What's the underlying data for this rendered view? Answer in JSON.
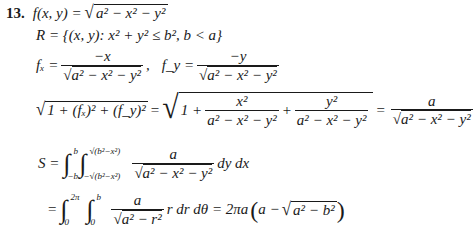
{
  "problem": {
    "number": "13.",
    "line1": {
      "lhs": "f(x, y) =",
      "radicand": "a² − x² − y²"
    },
    "line2": {
      "text": "R = {(x, y): x² + y² ≤ b²,  b < a}"
    },
    "line3": {
      "fx_label": "fₓ =",
      "fx_num": "−x",
      "fx_den": "a² − x² − y²",
      "sep": ",",
      "fy_label": "f_y =",
      "fy_num": "−y",
      "fy_den": "a² − x² − y²"
    },
    "line4": {
      "lhs_radicand": "1 + (fₓ)² + (f_y)²",
      "eq1": "=",
      "one_plus": "1 +",
      "t1_num": "x²",
      "t1_den": "a² − x² − y²",
      "plus": "+",
      "t2_num": "y²",
      "t2_den": "a² − x² − y²",
      "eq2": "=",
      "res_num": "a",
      "res_den": "a² − x² − y²"
    },
    "line5": {
      "lhs": "S =",
      "outer_upper": "b",
      "outer_lower": "−b",
      "inner_upper": "√(b²−x²)",
      "inner_lower": "−√(b²−x²)",
      "num": "a",
      "den": "a² − x² − y²",
      "diff": "dy dx"
    },
    "line6": {
      "eq": "=",
      "outer_upper": "2π",
      "outer_lower": "0",
      "inner_upper": "b",
      "inner_lower": "0",
      "num": "a",
      "den": "a² − r²",
      "diff": "r dr dθ = 2πa",
      "paren_a": "a −",
      "paren_radicand": "a² − b²"
    }
  }
}
